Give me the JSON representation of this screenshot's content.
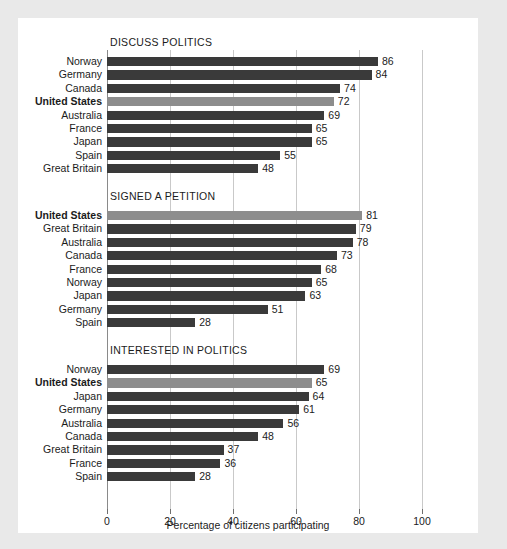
{
  "chart_data": {
    "type": "bar",
    "orientation": "horizontal",
    "title": "",
    "xlabel": "Percentage of citizens participating",
    "ylabel": "",
    "xlim": [
      0,
      100
    ],
    "xticks": [
      0,
      20,
      40,
      60,
      80,
      100
    ],
    "xtick_labels": [
      "0",
      "20",
      "40",
      "60",
      "80",
      "100"
    ],
    "grid": true,
    "legend": null,
    "highlight_category": "United States",
    "colors": {
      "bar": "#3a3a3a",
      "bar_highlight": "#8d8d8d",
      "gridline": "#c9c9c9",
      "axis": "#8a8a8a",
      "text": "#1b1b1b",
      "panel_background": "#ffffff",
      "page_background": "#e9e9e9"
    },
    "panels": [
      {
        "title": "DISCUSS POLITICS",
        "categories": [
          "Norway",
          "Germany",
          "Canada",
          "United States",
          "Australia",
          "France",
          "Japan",
          "Spain",
          "Great Britain"
        ],
        "values": [
          86,
          84,
          74,
          72,
          69,
          65,
          65,
          55,
          48
        ],
        "highlighted": [
          false,
          false,
          false,
          true,
          false,
          false,
          false,
          false,
          false
        ]
      },
      {
        "title": "SIGNED A PETITION",
        "categories": [
          "United States",
          "Great Britain",
          "Australia",
          "Canada",
          "France",
          "Norway",
          "Japan",
          "Germany",
          "Spain"
        ],
        "values": [
          81,
          79,
          78,
          73,
          68,
          65,
          63,
          51,
          28
        ],
        "highlighted": [
          true,
          false,
          false,
          false,
          false,
          false,
          false,
          false,
          false
        ]
      },
      {
        "title": "INTERESTED IN POLITICS",
        "categories": [
          "Norway",
          "United States",
          "Japan",
          "Germany",
          "Australia",
          "Canada",
          "Great Britain",
          "France",
          "Spain"
        ],
        "values": [
          69,
          65,
          64,
          61,
          56,
          48,
          37,
          36,
          28
        ],
        "highlighted": [
          false,
          true,
          false,
          false,
          false,
          false,
          false,
          false,
          false
        ]
      }
    ]
  }
}
